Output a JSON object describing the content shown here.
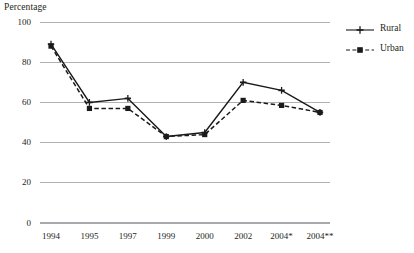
{
  "chart_data": {
    "type": "line",
    "title": "",
    "ylabel": "Percentage",
    "xlabel": "",
    "ylim": [
      0,
      100
    ],
    "yticks": [
      0,
      20,
      40,
      60,
      80,
      100
    ],
    "grid": true,
    "legend_position": "right",
    "categories": [
      "1994",
      "1995",
      "1997",
      "1999",
      "2000",
      "2002",
      "2004*",
      "2004**"
    ],
    "series": [
      {
        "name": "Rural",
        "style": "solid",
        "marker": "plus",
        "color": "#1a1a1a",
        "values": [
          89,
          60,
          62,
          43,
          45,
          70,
          66,
          55
        ]
      },
      {
        "name": "Urban",
        "style": "dashed",
        "marker": "square",
        "color": "#1a1a1a",
        "values": [
          88,
          57,
          57,
          43,
          44,
          61,
          58.5,
          55
        ]
      }
    ]
  },
  "legend": {
    "items": [
      {
        "label": "Rural"
      },
      {
        "label": "Urban"
      }
    ]
  },
  "axis": {
    "y_title": "Percentage"
  },
  "colors": {
    "gridline": "#a7a9ac",
    "series": "#1a1a1a",
    "text": "#231f20"
  }
}
